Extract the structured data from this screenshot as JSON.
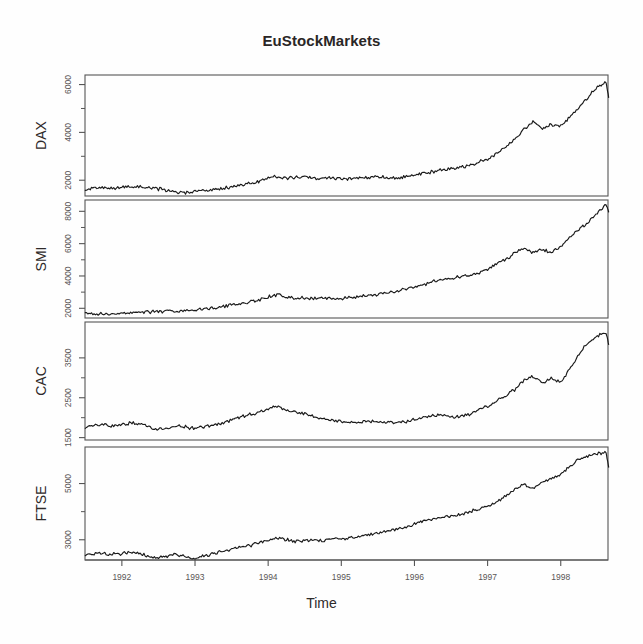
{
  "figure": {
    "title": "EuStockMarkets",
    "xlabel": "Time",
    "background_color": "#fefefe",
    "line_color": "#1a1a1a",
    "axis_color": "#555555"
  },
  "chart_data": {
    "type": "line",
    "title": "EuStockMarkets",
    "xlabel": "Time",
    "ylabel": "",
    "grid": false,
    "legend": null,
    "layout": "4 stacked panels sharing one x-axis",
    "xlim": [
      1991.496,
      1998.646
    ],
    "xticks": [
      1992,
      1993,
      1994,
      1995,
      1996,
      1997,
      1998
    ],
    "xticklabels": [
      "1992",
      "1993",
      "1994",
      "1995",
      "1996",
      "1997",
      "1998"
    ],
    "panels": [
      {
        "name": "DAX",
        "ylabel": "DAX",
        "ylim": [
          1340,
          6400
        ],
        "yticks": [
          2000,
          4000,
          6000
        ],
        "yticklabels": [
          "2000",
          "4000",
          "6000"
        ],
        "x": [
          1991.5,
          1991.62,
          1991.75,
          1991.87,
          1992.0,
          1992.12,
          1992.25,
          1992.37,
          1992.5,
          1992.62,
          1992.75,
          1992.87,
          1993.0,
          1993.12,
          1993.25,
          1993.37,
          1993.5,
          1993.62,
          1993.75,
          1993.87,
          1994.0,
          1994.12,
          1994.25,
          1994.37,
          1994.5,
          1994.62,
          1994.75,
          1994.87,
          1995.0,
          1995.12,
          1995.25,
          1995.37,
          1995.5,
          1995.62,
          1995.75,
          1995.87,
          1996.0,
          1996.12,
          1996.25,
          1996.37,
          1996.5,
          1996.62,
          1996.75,
          1996.87,
          1997.0,
          1997.12,
          1997.25,
          1997.37,
          1997.5,
          1997.62,
          1997.75,
          1997.87,
          1998.0,
          1998.12,
          1998.25,
          1998.37,
          1998.5,
          1998.62
        ],
        "values": [
          1629,
          1640,
          1680,
          1660,
          1700,
          1715,
          1720,
          1690,
          1640,
          1570,
          1500,
          1480,
          1520,
          1560,
          1600,
          1660,
          1720,
          1790,
          1870,
          1960,
          2090,
          2140,
          2080,
          2130,
          2150,
          2080,
          2060,
          2100,
          2060,
          2040,
          2080,
          2130,
          2120,
          2110,
          2080,
          2130,
          2220,
          2280,
          2350,
          2420,
          2480,
          2550,
          2630,
          2770,
          2900,
          3130,
          3400,
          3700,
          4120,
          4430,
          4150,
          4340,
          4260,
          4600,
          5050,
          5450,
          5900,
          6100
        ],
        "series_end_value": 5473
      },
      {
        "name": "SMI",
        "ylabel": "SMI",
        "ylim": [
          1400,
          8700
        ],
        "yticks": [
          2000,
          4000,
          6000,
          8000
        ],
        "yticklabels": [
          "2000",
          "4000",
          "6000",
          "8000"
        ],
        "x": [
          1991.5,
          1991.62,
          1991.75,
          1991.87,
          1992.0,
          1992.12,
          1992.25,
          1992.37,
          1992.5,
          1992.62,
          1992.75,
          1992.87,
          1993.0,
          1993.12,
          1993.25,
          1993.37,
          1993.5,
          1993.62,
          1993.75,
          1993.87,
          1994.0,
          1994.12,
          1994.25,
          1994.37,
          1994.5,
          1994.62,
          1994.75,
          1994.87,
          1995.0,
          1995.12,
          1995.25,
          1995.37,
          1995.5,
          1995.62,
          1995.75,
          1995.87,
          1996.0,
          1996.12,
          1996.25,
          1996.37,
          1996.5,
          1996.62,
          1996.75,
          1996.87,
          1997.0,
          1997.12,
          1997.25,
          1997.37,
          1997.5,
          1997.62,
          1997.75,
          1997.87,
          1998.0,
          1998.12,
          1998.25,
          1998.37,
          1998.5,
          1998.62
        ],
        "values": [
          1678,
          1690,
          1660,
          1620,
          1690,
          1740,
          1780,
          1760,
          1800,
          1840,
          1790,
          1830,
          1900,
          1960,
          2030,
          2110,
          2200,
          2290,
          2400,
          2520,
          2700,
          2860,
          2700,
          2650,
          2640,
          2600,
          2630,
          2600,
          2620,
          2680,
          2730,
          2790,
          2850,
          2950,
          3060,
          3190,
          3330,
          3480,
          3630,
          3760,
          3850,
          3950,
          4040,
          4180,
          4400,
          4700,
          5000,
          5450,
          5700,
          5450,
          5630,
          5450,
          5800,
          6400,
          6900,
          7300,
          7900,
          8400
        ],
        "series_end_value": 7992
      },
      {
        "name": "CAC",
        "ylabel": "CAC",
        "ylim": [
          1440,
          4400
        ],
        "yticks": [
          1500,
          2500,
          3500
        ],
        "yticklabels": [
          "1500",
          "2500",
          "3500"
        ],
        "x": [
          1991.5,
          1991.62,
          1991.75,
          1991.87,
          1992.0,
          1992.12,
          1992.25,
          1992.37,
          1992.5,
          1992.62,
          1992.75,
          1992.87,
          1993.0,
          1993.12,
          1993.25,
          1993.37,
          1993.5,
          1993.62,
          1993.75,
          1993.87,
          1994.0,
          1994.12,
          1994.25,
          1994.37,
          1994.5,
          1994.62,
          1994.75,
          1994.87,
          1995.0,
          1995.12,
          1995.25,
          1995.37,
          1995.5,
          1995.62,
          1995.75,
          1995.87,
          1996.0,
          1996.12,
          1996.25,
          1996.37,
          1996.5,
          1996.62,
          1996.75,
          1996.87,
          1997.0,
          1997.12,
          1997.25,
          1997.37,
          1997.5,
          1997.62,
          1997.75,
          1997.87,
          1998.0,
          1998.12,
          1998.25,
          1998.37,
          1998.5,
          1998.62
        ],
        "values": [
          1772,
          1800,
          1840,
          1790,
          1830,
          1870,
          1840,
          1760,
          1700,
          1740,
          1800,
          1770,
          1730,
          1760,
          1810,
          1880,
          1930,
          2010,
          2080,
          2130,
          2220,
          2280,
          2180,
          2140,
          2090,
          2020,
          1970,
          1930,
          1900,
          1880,
          1890,
          1920,
          1900,
          1890,
          1860,
          1900,
          1950,
          2000,
          2050,
          2080,
          2040,
          2030,
          2090,
          2180,
          2280,
          2420,
          2560,
          2700,
          2950,
          3040,
          2850,
          2980,
          2900,
          3200,
          3600,
          3900,
          4050,
          4120
        ],
        "series_end_value": 3846
      },
      {
        "name": "FTSE",
        "ylabel": "FTSE",
        "ylim": [
          2280,
          6300
        ],
        "yticks": [
          3000,
          5000
        ],
        "yticklabels": [
          "3000",
          "5000"
        ],
        "x": [
          1991.5,
          1991.62,
          1991.75,
          1991.87,
          1992.0,
          1992.12,
          1992.25,
          1992.37,
          1992.5,
          1992.62,
          1992.75,
          1992.87,
          1993.0,
          1993.12,
          1993.25,
          1993.37,
          1993.5,
          1993.62,
          1993.75,
          1993.87,
          1994.0,
          1994.12,
          1994.25,
          1994.37,
          1994.5,
          1994.62,
          1994.75,
          1994.87,
          1995.0,
          1995.12,
          1995.25,
          1995.37,
          1995.5,
          1995.62,
          1995.75,
          1995.87,
          1996.0,
          1996.12,
          1996.25,
          1996.37,
          1996.5,
          1996.62,
          1996.75,
          1996.87,
          1997.0,
          1997.12,
          1997.25,
          1997.37,
          1997.5,
          1997.62,
          1997.75,
          1997.87,
          1998.0,
          1998.12,
          1998.25,
          1998.37,
          1998.5,
          1998.62
        ],
        "values": [
          2444,
          2500,
          2530,
          2480,
          2510,
          2550,
          2520,
          2400,
          2370,
          2420,
          2480,
          2390,
          2350,
          2420,
          2520,
          2600,
          2680,
          2740,
          2800,
          2880,
          2980,
          3080,
          3010,
          2930,
          2960,
          3000,
          2980,
          3030,
          3020,
          3060,
          3100,
          3180,
          3230,
          3300,
          3380,
          3470,
          3560,
          3650,
          3720,
          3790,
          3850,
          3900,
          3990,
          4080,
          4200,
          4350,
          4550,
          4800,
          4980,
          4840,
          5050,
          5150,
          5330,
          5600,
          5850,
          5980,
          6050,
          6100
        ],
        "series_end_value": 5587
      }
    ]
  }
}
